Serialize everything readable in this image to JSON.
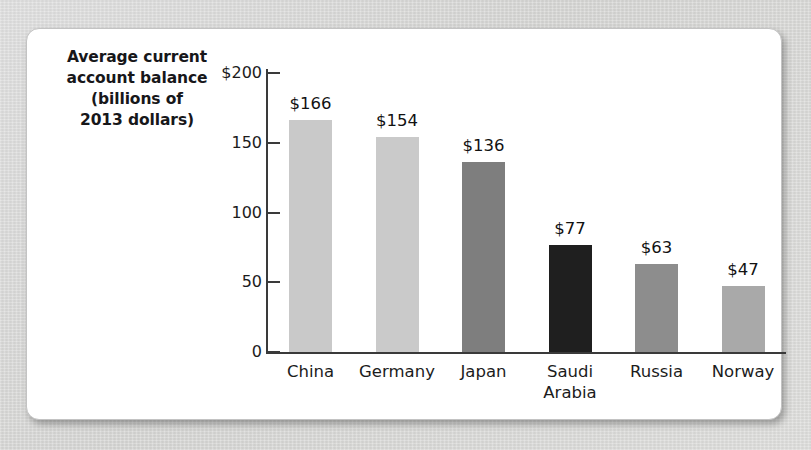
{
  "figure": {
    "axis_title_lines": [
      "Average current",
      "account balance",
      "(billions of",
      "2013 dollars)"
    ]
  },
  "chart_data": {
    "type": "bar",
    "xlabel": "",
    "ylabel": "Average current account balance (billions of 2013 dollars)",
    "ylim": [
      0,
      200
    ],
    "yticks": [
      0,
      50,
      100,
      150,
      200
    ],
    "ytick_labels": [
      "0",
      "50",
      "100",
      "150",
      "$200"
    ],
    "grid": false,
    "legend": "none",
    "value_label_prefix": "$",
    "categories": [
      "China",
      "Germany",
      "Japan",
      "Saudi Arabia",
      "Russia",
      "Norway"
    ],
    "values": [
      166,
      154,
      136,
      77,
      63,
      47
    ],
    "value_labels": [
      "$166",
      "$154",
      "$136",
      "$77",
      "$63",
      "$47"
    ],
    "bar_colors": [
      "#c9c9c9",
      "#cacaca",
      "#7e7e7e",
      "#1f1f1f",
      "#8d8d8d",
      "#a9a9a9"
    ],
    "category_label_lines": [
      [
        "China"
      ],
      [
        "Germany"
      ],
      [
        "Japan"
      ],
      [
        "Saudi",
        "Arabia"
      ],
      [
        "Russia"
      ],
      [
        "Norway"
      ]
    ]
  },
  "colors": {
    "page_background": "#d9d9d7",
    "card_background": "#ffffff",
    "axis": "#3a3a3a",
    "text": "#1c1c1c"
  }
}
